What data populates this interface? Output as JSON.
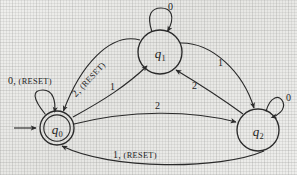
{
  "figure": {
    "kind": "finite-state-machine-diagram",
    "title": "",
    "ink_color": "#2a2a2a",
    "paper_color": "#e9e9e7"
  },
  "automaton": {
    "alphabet": [
      "0",
      "1",
      "2",
      "RESET"
    ],
    "start_state": "q0",
    "accepting_states": [
      "q0"
    ],
    "states": [
      {
        "id": "q0",
        "label": "q",
        "subscript": "0",
        "cx": 57,
        "cy": 128,
        "r": 17,
        "double": true,
        "start": true
      },
      {
        "id": "q1",
        "label": "q",
        "subscript": "1",
        "cx": 160,
        "cy": 52,
        "r": 22,
        "double": false,
        "start": false
      },
      {
        "id": "q2",
        "label": "q",
        "subscript": "2",
        "cx": 258,
        "cy": 130,
        "r": 21,
        "double": false,
        "start": false
      }
    ],
    "transitions": [
      {
        "from": "q0",
        "to": "q0",
        "symbol": "0",
        "reset": true,
        "label": "0, (RESET)",
        "kind": "self-loop",
        "label_x": 8,
        "label_y": 82
      },
      {
        "from": "q1",
        "to": "q1",
        "symbol": "0",
        "reset": false,
        "label": "0",
        "kind": "self-loop",
        "label_x": 167,
        "label_y": 3
      },
      {
        "from": "q2",
        "to": "q2",
        "symbol": "0",
        "reset": false,
        "label": "0",
        "kind": "self-loop",
        "label_x": 285,
        "label_y": 94
      },
      {
        "from": "q0",
        "to": "q1",
        "symbol": "1",
        "reset": false,
        "label": "1",
        "kind": "curve",
        "label_x": 107,
        "label_y": 84
      },
      {
        "from": "q1",
        "to": "q0",
        "symbol": "2",
        "reset": true,
        "label": "2, (RESET)",
        "kind": "curve",
        "label_x": 70,
        "label_y": 84
      },
      {
        "from": "q1",
        "to": "q2",
        "symbol": "1",
        "reset": false,
        "label": "1",
        "kind": "curve",
        "label_x": 215,
        "label_y": 62
      },
      {
        "from": "q2",
        "to": "q1",
        "symbol": "2",
        "reset": false,
        "label": "2",
        "kind": "curve",
        "label_x": 190,
        "label_y": 84
      },
      {
        "from": "q0",
        "to": "q2",
        "symbol": "2",
        "reset": false,
        "label": "2",
        "kind": "curve",
        "label_x": 155,
        "label_y": 104
      },
      {
        "from": "q2",
        "to": "q0",
        "symbol": "1",
        "reset": true,
        "label": "1, (RESET)",
        "kind": "curve",
        "label_x": 128,
        "label_y": 151
      }
    ]
  },
  "labels": {
    "reset_word": "(RESET)",
    "q0_selfloop": {
      "symbol": "0",
      "suffix": ", "
    },
    "q1_selfloop": {
      "symbol": "0"
    },
    "q2_selfloop": {
      "symbol": "0"
    },
    "q0_to_q1": {
      "symbol": "1"
    },
    "q1_to_q0": {
      "symbol": "2",
      "suffix": ", "
    },
    "q1_to_q2": {
      "symbol": "1"
    },
    "q2_to_q1": {
      "symbol": "2"
    },
    "q0_to_q2": {
      "symbol": "2"
    },
    "q2_to_q0": {
      "symbol": "1",
      "suffix": ", "
    }
  }
}
